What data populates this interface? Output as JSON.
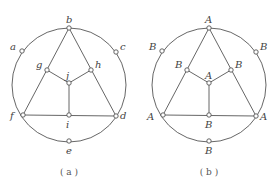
{
  "figures": [
    {
      "id": "a",
      "caption": "( a )",
      "labels": {
        "b": "b",
        "a": "a",
        "c": "c",
        "g": "g",
        "h": "h",
        "j": "j",
        "f": "f",
        "i": "i",
        "d": "d",
        "e": "e"
      }
    },
    {
      "id": "b",
      "caption": "( b )",
      "labels": {
        "b": "A",
        "a": "B",
        "c": "B",
        "g": "B",
        "h": "B",
        "j": "A",
        "f": "A",
        "i": "B",
        "d": "A",
        "e": "B"
      }
    }
  ]
}
